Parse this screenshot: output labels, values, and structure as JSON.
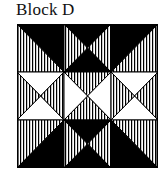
{
  "title": "Block D",
  "colors": {
    "black": "#000000",
    "white": "#ffffff",
    "line": "#000000"
  },
  "grid": {
    "rows": 3,
    "cols": 3,
    "cells": [
      {
        "row": 0,
        "col": 0,
        "type": "diag-tlbr",
        "tri_a": "black",
        "tri_b": "hatched"
      },
      {
        "row": 0,
        "col": 1,
        "type": "x",
        "top": "black",
        "right": "hatched",
        "bottom": "black",
        "left": "hatched"
      },
      {
        "row": 0,
        "col": 2,
        "type": "diag-bltr",
        "tri_a": "black",
        "tri_b": "hatched"
      },
      {
        "row": 1,
        "col": 0,
        "type": "x",
        "top": "white",
        "right": "hatched",
        "bottom": "white",
        "left": "hatched"
      },
      {
        "row": 1,
        "col": 1,
        "type": "x",
        "top": "hatched",
        "right": "white",
        "bottom": "hatched",
        "left": "white"
      },
      {
        "row": 1,
        "col": 2,
        "type": "x",
        "top": "white",
        "right": "hatched",
        "bottom": "white",
        "left": "hatched"
      },
      {
        "row": 2,
        "col": 0,
        "type": "diag-bltr",
        "tri_a": "hatched",
        "tri_b": "black"
      },
      {
        "row": 2,
        "col": 1,
        "type": "x",
        "top": "black",
        "right": "hatched",
        "bottom": "black",
        "left": "hatched"
      },
      {
        "row": 2,
        "col": 2,
        "type": "diag-tlbr",
        "tri_a": "hatched",
        "tri_b": "black"
      }
    ]
  }
}
